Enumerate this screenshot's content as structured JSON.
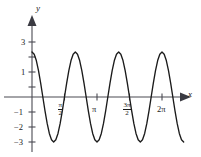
{
  "figure": {
    "kind": "cartesian-plot",
    "background": "#ffffff",
    "curve_color": "#1b1b1b",
    "axis_color": "#4a4a52"
  },
  "axes": {
    "x_label": "x",
    "y_label": "y",
    "x_arrow_icon": "arrow-right-icon",
    "y_arrow_icon": "arrow-up-icon",
    "x_ticks": [
      {
        "label_num": "π",
        "label_den": "2",
        "is_fraction": true,
        "value": 1.5707963,
        "px": 64.5
      },
      {
        "label_num": "π",
        "label_den": "",
        "is_fraction": false,
        "value": 3.1415927,
        "px": 97.0
      },
      {
        "label_num": "3π",
        "label_den": "2",
        "is_fraction": true,
        "value": 4.712389,
        "px": 129.5
      },
      {
        "label_num": "2π",
        "label_den": "",
        "is_fraction": false,
        "value": 6.2831853,
        "px": 162.0
      }
    ],
    "y_ticks": [
      {
        "label": "3",
        "value": 3,
        "px": 42
      },
      {
        "label": "1",
        "value": 1,
        "px": 72
      },
      {
        "label": "−1",
        "value": -1,
        "px": 112
      },
      {
        "label": "−2",
        "value": -2,
        "px": 127
      },
      {
        "label": "−3",
        "value": -3,
        "px": 142
      }
    ]
  },
  "chart_data": {
    "type": "line",
    "title": "",
    "xlabel": "x",
    "ylabel": "y",
    "function": "y = 3 cos(3x)",
    "amplitude": 3,
    "period": 2.0943951,
    "frequency": 3,
    "xlim": [
      0,
      7.3303829
    ],
    "ylim": [
      -3.6,
      3.6
    ],
    "grid": false,
    "legend": "none",
    "x_tick_labels": [
      "π/2",
      "π",
      "3π/2",
      "2π"
    ],
    "x_tick_values": [
      1.5707963,
      3.1415927,
      4.712389,
      6.2831853
    ],
    "y_tick_labels": [
      "3",
      "1",
      "-1",
      "-2",
      "-3"
    ],
    "y_tick_values": [
      3,
      1,
      -1,
      -2,
      -3
    ],
    "key_points": [
      {
        "x": 0.0,
        "y": 3,
        "kind": "maximum"
      },
      {
        "x": 0.5235988,
        "y": 0,
        "kind": "zero"
      },
      {
        "x": 1.0471976,
        "y": -3,
        "kind": "minimum"
      },
      {
        "x": 1.5707963,
        "y": 0,
        "kind": "zero"
      },
      {
        "x": 2.0943951,
        "y": 3,
        "kind": "maximum"
      },
      {
        "x": 2.6179939,
        "y": 0,
        "kind": "zero"
      },
      {
        "x": 3.1415927,
        "y": -3,
        "kind": "minimum"
      },
      {
        "x": 3.6651914,
        "y": 0,
        "kind": "zero"
      },
      {
        "x": 4.1887902,
        "y": 3,
        "kind": "maximum"
      },
      {
        "x": 4.712389,
        "y": 0,
        "kind": "zero"
      },
      {
        "x": 5.2359878,
        "y": -3,
        "kind": "minimum"
      },
      {
        "x": 5.7595865,
        "y": 0,
        "kind": "zero"
      },
      {
        "x": 6.2831853,
        "y": 3,
        "kind": "maximum"
      },
      {
        "x": 6.8067841,
        "y": 0,
        "kind": "zero"
      }
    ],
    "x": [
      0,
      0.1047,
      0.2094,
      0.3142,
      0.4189,
      0.5236,
      0.6283,
      0.733,
      0.8378,
      0.9425,
      1.0472,
      1.1519,
      1.2566,
      1.3614,
      1.4661,
      1.5708,
      1.6755,
      1.7802,
      1.885,
      1.9897,
      2.0944,
      2.1991,
      2.3038,
      2.4086,
      2.5133,
      2.618,
      2.7227,
      2.8274,
      2.9322,
      3.0369,
      3.1416,
      3.2463,
      3.351,
      3.4558,
      3.5605,
      3.6652,
      3.7699,
      3.8746,
      3.9794,
      4.0841,
      4.1888,
      4.2935,
      4.3982,
      4.503,
      4.6077,
      4.7124,
      4.8171,
      4.9218,
      5.0265,
      5.1313,
      5.236,
      5.3407,
      5.4454,
      5.5501,
      5.6549,
      5.7596,
      5.8643,
      5.969,
      6.0738,
      6.1785,
      6.2832,
      6.3879,
      6.4926,
      6.5973,
      6.7021,
      6.8068,
      6.9115,
      7.0162,
      7.1209,
      7.2257,
      7.3304
    ],
    "y": [
      3.0,
      2.854,
      2.427,
      1.763,
      0.927,
      0.0,
      -0.927,
      -1.763,
      -2.427,
      -2.854,
      -3.0,
      -2.854,
      -2.427,
      -1.763,
      -0.927,
      0.0,
      0.927,
      1.763,
      2.427,
      2.854,
      3.0,
      2.854,
      2.427,
      1.763,
      0.927,
      0.0,
      -0.927,
      -1.763,
      -2.427,
      -2.854,
      -3.0,
      -2.854,
      -2.427,
      -1.763,
      -0.927,
      0.0,
      0.927,
      1.763,
      2.427,
      2.854,
      3.0,
      2.854,
      2.427,
      1.763,
      0.927,
      0.0,
      -0.927,
      -1.763,
      -2.427,
      -2.854,
      -3.0,
      -2.854,
      -2.427,
      -1.763,
      -0.927,
      0.0,
      0.927,
      1.763,
      2.427,
      2.854,
      3.0,
      2.854,
      2.427,
      1.763,
      0.927,
      0.0,
      -0.927,
      -1.763,
      -2.427,
      -2.854,
      -3.0
    ]
  }
}
